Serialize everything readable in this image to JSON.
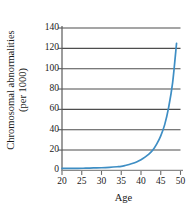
{
  "chart_data": {
    "type": "line",
    "title": "",
    "xlabel": "Age",
    "ylabel": "Chromosomal abnormalities",
    "ylabel_line2": "(per 1000)",
    "xlim": [
      20,
      50
    ],
    "ylim": [
      0,
      140
    ],
    "xticks": [
      20,
      25,
      30,
      35,
      40,
      45,
      50
    ],
    "yticks": [
      0,
      20,
      40,
      60,
      80,
      100,
      120,
      140
    ],
    "xtick_labels": [
      "20",
      "25",
      "30",
      "35",
      "40",
      "45",
      "50"
    ],
    "ytick_labels": [
      "0",
      "20",
      "40",
      "60",
      "80",
      "100",
      "120",
      "140"
    ],
    "grid": "horizontal",
    "legend": "none",
    "series": [
      {
        "name": "Chromosomal abnormalities per 1000",
        "color": "#3e8ec4",
        "x": [
          20,
          22,
          24,
          26,
          28,
          30,
          32,
          34,
          35,
          36,
          37,
          38,
          39,
          40,
          41,
          42,
          43,
          44,
          45,
          46,
          47,
          48,
          49
        ],
        "values": [
          2,
          2,
          2,
          2.2,
          2.4,
          2.6,
          3,
          3.6,
          4,
          4.8,
          5.8,
          7,
          8.5,
          10.5,
          13,
          16,
          20,
          26,
          34,
          45,
          62,
          86,
          125
        ]
      }
    ],
    "colors": {
      "curve": "#3e8ec4",
      "axis": "#5a5a5a",
      "grid": "#4d4d4d",
      "text": "#1a1a1a",
      "background": "#ffffff"
    }
  },
  "axis": {
    "x_title": "Age",
    "y_title_line1": "Chromosomal abnormalities",
    "y_title_line2": "(per 1000)"
  }
}
